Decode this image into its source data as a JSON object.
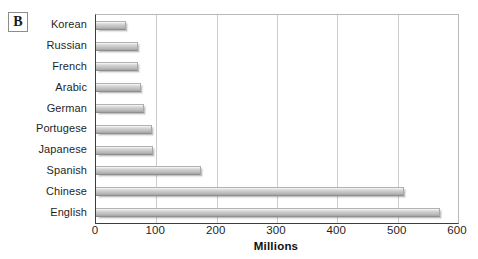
{
  "figure": {
    "panel_letter": "B",
    "background_color": "#ffffff",
    "frame_color": "#3d3d3d",
    "grid_color": "#cccccc",
    "bar_color": "#c2c2c2",
    "text_color": "#1f1f1f"
  },
  "chart_data": {
    "type": "bar",
    "orientation": "horizontal",
    "title": "",
    "subtitle": "",
    "xlabel": "Millions",
    "ylabel": "",
    "xlim": [
      0,
      600
    ],
    "ylim": null,
    "grid": true,
    "grid_axis": "x",
    "legend": false,
    "legend_position": "none",
    "xticks": [
      0,
      100,
      200,
      300,
      400,
      500,
      600
    ],
    "xtick_labels": [
      "0",
      "100",
      "200",
      "300",
      "400",
      "500",
      "600"
    ],
    "categories": [
      "Korean",
      "Russian",
      "French",
      "Arabic",
      "German",
      "Portugese",
      "Japanese",
      "Spanish",
      "Chinese",
      "English"
    ],
    "values": [
      50,
      70,
      70,
      75,
      80,
      93,
      95,
      174,
      510,
      570
    ],
    "annotations": [
      {
        "text": "B",
        "role": "panel-label",
        "position": "top-left"
      }
    ]
  }
}
